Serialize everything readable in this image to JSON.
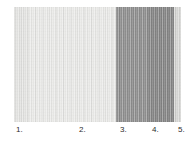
{
  "figure": {
    "background_color": "#ffffff",
    "strip": {
      "left": 14,
      "top": 7,
      "width": 167,
      "height": 115,
      "description": "grayscale vertically-striated image strip"
    },
    "bands": [
      {
        "name": "band-1-light",
        "x": 0,
        "width": 14,
        "color": "#e4e4e2"
      },
      {
        "name": "band-2-light",
        "x": 14,
        "width": 88,
        "color": "#eaeae8"
      },
      {
        "name": "band-3-dark",
        "x": 102,
        "width": 32,
        "color": "#8f8f8f"
      },
      {
        "name": "band-4-darker",
        "x": 134,
        "width": 26,
        "color": "#858585"
      },
      {
        "name": "band-5-light",
        "x": 160,
        "width": 7,
        "color": "#d7d7d5"
      }
    ],
    "axis": {
      "tick_labels": [
        {
          "text": "1.",
          "x": 16
        },
        {
          "text": "2.",
          "x": 79
        },
        {
          "text": "3.",
          "x": 120
        },
        {
          "text": "4.",
          "x": 152
        },
        {
          "text": "5.",
          "x": 178
        }
      ]
    }
  },
  "chart_data": {
    "type": "heatmap",
    "title": "",
    "subtitle": "",
    "xlabel": "",
    "ylabel": "",
    "grid": false,
    "legend": null,
    "orientation": "horizontal",
    "categories": [
      "1.",
      "2.",
      "3.",
      "4.",
      "5."
    ],
    "tick_positions": [
      16,
      79,
      120,
      152,
      178
    ],
    "x": [
      0,
      14,
      102,
      134,
      160,
      167
    ],
    "segments": [
      {
        "label": "1.",
        "x_start": 0,
        "x_end": 14,
        "gray_level": 228,
        "hex": "#e4e4e2"
      },
      {
        "label": "2.",
        "x_start": 14,
        "x_end": 102,
        "gray_level": 234,
        "hex": "#eaeae8"
      },
      {
        "label": "3.",
        "x_start": 102,
        "x_end": 134,
        "gray_level": 143,
        "hex": "#8f8f8f"
      },
      {
        "label": "4.",
        "x_start": 134,
        "x_end": 160,
        "gray_level": 133,
        "hex": "#858585"
      },
      {
        "label": "5.",
        "x_start": 160,
        "x_end": 167,
        "gray_level": 215,
        "hex": "#d7d7d5"
      }
    ],
    "values": [
      228,
      234,
      143,
      133,
      215
    ],
    "ylim": [
      0,
      255
    ],
    "xlim": [
      0,
      167
    ]
  }
}
